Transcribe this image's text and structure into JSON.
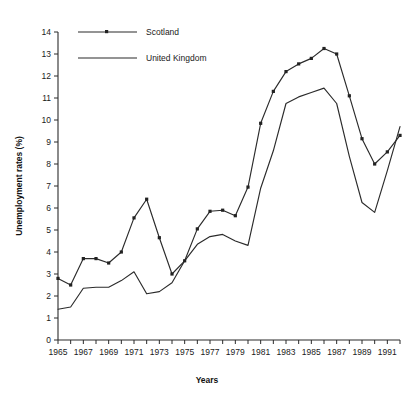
{
  "chart_data": {
    "type": "line",
    "title": "",
    "xlabel": "Years",
    "ylabel": "Unemployment rates (%)",
    "xlim": [
      1965,
      1992
    ],
    "ylim": [
      0,
      14
    ],
    "grid": false,
    "legend_position": "top-left",
    "x": [
      1965,
      1966,
      1967,
      1968,
      1969,
      1970,
      1971,
      1972,
      1973,
      1974,
      1975,
      1976,
      1977,
      1978,
      1979,
      1980,
      1981,
      1982,
      1983,
      1984,
      1985,
      1986,
      1987,
      1988,
      1989,
      1990,
      1991,
      1992
    ],
    "xtick_labels": [
      "1965",
      "1967",
      "1969",
      "1971",
      "1973",
      "1975",
      "1977",
      "1979",
      "1981",
      "1983",
      "1985",
      "1987",
      "1989",
      "1991"
    ],
    "xtick_values": [
      1965,
      1967,
      1969,
      1971,
      1973,
      1975,
      1977,
      1979,
      1981,
      1983,
      1985,
      1987,
      1989,
      1991
    ],
    "ytick_labels": [
      "0",
      "1",
      "2",
      "3",
      "4",
      "5",
      "6",
      "7",
      "8",
      "9",
      "10",
      "11",
      "12",
      "13",
      "14"
    ],
    "ytick_values": [
      0,
      1,
      2,
      3,
      4,
      5,
      6,
      7,
      8,
      9,
      10,
      11,
      12,
      13,
      14
    ],
    "series": [
      {
        "name": "Scotland",
        "marker": "square",
        "color": "#222222",
        "values": [
          2.8,
          2.5,
          3.7,
          3.7,
          3.5,
          4.0,
          5.55,
          6.4,
          4.65,
          3.0,
          3.6,
          5.05,
          5.85,
          5.9,
          5.65,
          6.95,
          9.85,
          11.3,
          12.2,
          12.55,
          12.8,
          13.25,
          13.0,
          11.1,
          9.15,
          8.0,
          8.55,
          9.3
        ]
      },
      {
        "name": "United Kingdom",
        "marker": "none",
        "color": "#222222",
        "values": [
          1.4,
          1.5,
          2.35,
          2.4,
          2.4,
          2.7,
          3.1,
          2.1,
          2.2,
          2.6,
          3.6,
          4.35,
          4.7,
          4.8,
          4.5,
          4.3,
          6.9,
          8.6,
          10.75,
          11.05,
          11.25,
          11.45,
          10.75,
          8.35,
          6.25,
          5.8,
          7.7,
          9.7
        ]
      }
    ],
    "legend_entries": [
      "Scotland",
      "United Kingdom"
    ]
  },
  "figure": {
    "legend": {
      "scotland_label": "Scotland",
      "uk_label": "United Kingdom"
    },
    "axes": {
      "y_title": "Unemployment rates (%)",
      "x_title": "Years"
    }
  }
}
